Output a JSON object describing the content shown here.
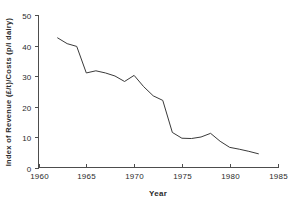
{
  "chart_data": {
    "type": "line",
    "title": "",
    "xlabel": "Year",
    "ylabel": "Index of Revenue (£/t)/Costs (p/l dairy)",
    "xlim": [
      1960,
      1985
    ],
    "ylim": [
      0,
      50
    ],
    "xticks": [
      1960,
      1965,
      1970,
      1975,
      1980,
      1985
    ],
    "xtick_labels": [
      "1960",
      "1965",
      "1970",
      "1975",
      "1980",
      "1985"
    ],
    "yticks": [
      0,
      10,
      20,
      30,
      40,
      50
    ],
    "ytick_labels": [
      "0",
      "10",
      "20",
      "30",
      "40",
      "50"
    ],
    "grid": false,
    "legend": false,
    "legend_position": "none",
    "line_color": "#3a3a3a",
    "axis_color": "#4d4d4d",
    "background_color": "#ffffff",
    "x": [
      1962,
      1963,
      1964,
      1965,
      1966,
      1967,
      1968,
      1969,
      1970,
      1971,
      1972,
      1973,
      1974,
      1975,
      1976,
      1977,
      1978,
      1979,
      1980,
      1981,
      1982,
      1983
    ],
    "series": [
      {
        "name": "Index of Revenue/Costs",
        "values": [
          42.5,
          40.6,
          39.7,
          31.0,
          31.7,
          31.0,
          30.0,
          28.2,
          30.2,
          26.5,
          23.5,
          22.0,
          11.5,
          9.6,
          9.5,
          10.0,
          11.2,
          8.6,
          6.6,
          6.0,
          5.3,
          4.5
        ]
      }
    ]
  }
}
